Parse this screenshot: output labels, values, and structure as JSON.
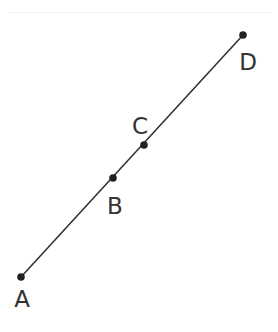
{
  "diagram": {
    "type": "collinear-points",
    "line_color": "#333333",
    "point_color": "#222222",
    "segment": {
      "from": "A",
      "to": "D"
    },
    "points": [
      {
        "label": "A",
        "x": 21,
        "y": 277,
        "label_x": 22,
        "label_y": 307
      },
      {
        "label": "B",
        "x": 113,
        "y": 178,
        "label_x": 115,
        "label_y": 214
      },
      {
        "label": "C",
        "x": 144,
        "y": 145,
        "label_x": 140,
        "label_y": 134
      },
      {
        "label": "D",
        "x": 243,
        "y": 35,
        "label_x": 248,
        "label_y": 70
      }
    ]
  }
}
